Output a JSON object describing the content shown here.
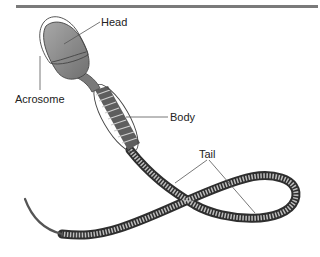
{
  "figure": {
    "type": "labeled anatomical diagram",
    "colors": {
      "rule": "#7a7a7a",
      "head_fill": "#8e8e8e",
      "midpiece_fill": "#6e6e6e",
      "tail_stroke": "#3a3a3a",
      "outline": "#444444",
      "leader": "#555555"
    }
  },
  "labels": {
    "head": "Head",
    "acrosome": "Acrosome",
    "body": "Body",
    "tail": "Tail"
  }
}
